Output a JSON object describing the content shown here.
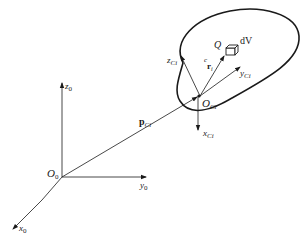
{
  "diagram": {
    "title": "",
    "frames": {
      "base": {
        "origin": {
          "name": "O",
          "sub": "0"
        },
        "axes": [
          {
            "name": "x",
            "sub": "0"
          },
          {
            "name": "y",
            "sub": "0"
          },
          {
            "name": "z",
            "sub": "0"
          }
        ]
      },
      "body": {
        "origin": {
          "name": "O",
          "sub": "Ci"
        },
        "axes": [
          {
            "name": "x",
            "sub": "Ci"
          },
          {
            "name": "y",
            "sub": "Ci"
          },
          {
            "name": "z",
            "sub": "Ci"
          }
        ]
      }
    },
    "vectors": {
      "position": {
        "name": "p",
        "sub": "Ci"
      },
      "relative": {
        "pre": "c",
        "name": "r",
        "sub": "i"
      }
    },
    "point": {
      "name": "Q"
    },
    "volume_element": {
      "name": "dV"
    },
    "colors": {
      "stroke": "#1a1a1a",
      "background": "#ffffff"
    }
  }
}
